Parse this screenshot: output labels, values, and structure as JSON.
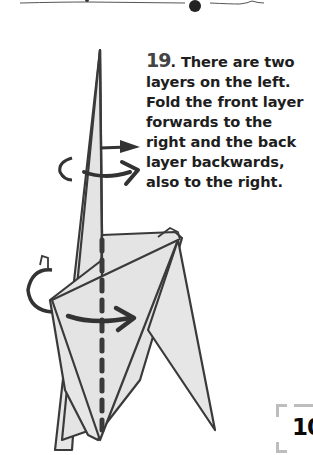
{
  "step": {
    "number": "19",
    "separator": ".",
    "text": " There are two layers on the left. Fold the front layer forwards to the right and the back layer backwards, also to the right."
  },
  "page": {
    "number": "10"
  },
  "diagram": {
    "fold_line_style": "dashed-vertical",
    "arrows": [
      {
        "type": "mountain-fold-arrow",
        "direction": "right",
        "position": "upper"
      },
      {
        "type": "valley-fold-arrow",
        "direction": "right",
        "position": "upper"
      },
      {
        "type": "mountain-fold-arrow",
        "direction": "right",
        "position": "lower"
      },
      {
        "type": "valley-fold-arrow",
        "direction": "right",
        "position": "lower"
      }
    ],
    "colors": {
      "paper_fill": "#e6e6e6",
      "outline": "#3a3a3a",
      "background": "#ffffff"
    }
  }
}
